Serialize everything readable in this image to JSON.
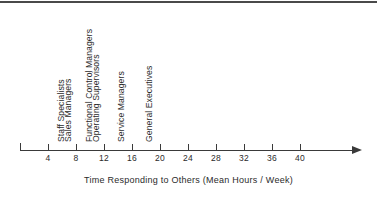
{
  "chart_data": {
    "type": "scatter",
    "title": "",
    "xlabel": "Time Responding to Others (Mean Hours / Week)",
    "ylabel": "",
    "xlim": [
      0,
      42
    ],
    "grid": false,
    "legend": "none",
    "axis_origin_tick": 0,
    "tick_values": [
      4,
      8,
      12,
      16,
      20,
      24,
      28,
      32,
      36,
      40
    ],
    "tick_labels": [
      "4",
      "8",
      "12",
      "16",
      "20",
      "24",
      "28",
      "32",
      "36",
      "40"
    ],
    "categories": [
      "Staff Specialists",
      "Sales Managers",
      "Functional Control Managers",
      "Operating Supervisors",
      "Service Managers",
      "General Executives"
    ],
    "values": [
      7.0,
      8.0,
      11.0,
      12.0,
      15.5,
      19.5
    ],
    "points": [
      {
        "label": "Staff Specialists",
        "value": 7.0
      },
      {
        "label": "Sales Managers",
        "value": 8.0
      },
      {
        "label": "Functional Control Managers",
        "value": 11.0
      },
      {
        "label": "Operating Supervisors",
        "value": 12.0
      },
      {
        "label": "Service Managers",
        "value": 15.5
      },
      {
        "label": "General Executives",
        "value": 19.5
      }
    ]
  },
  "colors": {
    "axis": "#3a3a3a",
    "text": "#2b2b2b",
    "rule": "#4a4a4a",
    "background": "#ffffff"
  }
}
